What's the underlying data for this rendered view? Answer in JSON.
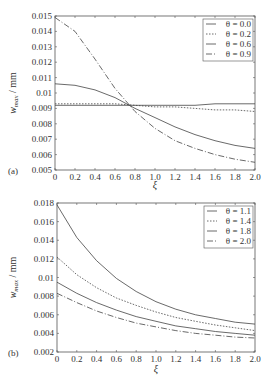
{
  "chart_data": [
    {
      "type": "line",
      "panel_label": "(a)",
      "title": "",
      "xlabel": "ξ",
      "ylabel": "w_max / mm",
      "xlim": [
        0,
        2.0
      ],
      "ylim": [
        0.005,
        0.015
      ],
      "x_ticks": [
        "0",
        "0.2",
        "0.4",
        "0.6",
        "0.8",
        "1.0",
        "1.2",
        "1.4",
        "1.6",
        "1.8",
        "2.0"
      ],
      "y_ticks": [
        "0.005",
        "0.006",
        "0.007",
        "0.008",
        "0.009",
        "0.01",
        "0.011",
        "0.012",
        "0.013",
        "0.014",
        "0.015"
      ],
      "grid": false,
      "legend_position": "upper right",
      "x": [
        0,
        0.2,
        0.4,
        0.6,
        0.8,
        1.0,
        1.2,
        1.4,
        1.6,
        1.8,
        2.0
      ],
      "series": [
        {
          "name": "θ = 0.0",
          "style": "solid",
          "values": [
            0.0092,
            0.0092,
            0.0092,
            0.0092,
            0.0092,
            0.0092,
            0.0092,
            0.0092,
            0.0093,
            0.0093,
            0.0093
          ]
        },
        {
          "name": "θ = 0.2",
          "style": "dotted",
          "values": [
            0.0093,
            0.0093,
            0.0093,
            0.0093,
            0.0092,
            0.0091,
            0.0091,
            0.009,
            0.0089,
            0.0089,
            0.0088
          ]
        },
        {
          "name": "θ = 0.6",
          "style": "solid",
          "values": [
            0.0106,
            0.0105,
            0.0102,
            0.0097,
            0.009,
            0.0084,
            0.0078,
            0.0073,
            0.0069,
            0.0066,
            0.0064
          ]
        },
        {
          "name": "θ = 0.9",
          "style": "dashdot",
          "values": [
            0.0149,
            0.014,
            0.0122,
            0.0103,
            0.0088,
            0.0077,
            0.0069,
            0.0064,
            0.006,
            0.0057,
            0.0055
          ]
        }
      ]
    },
    {
      "type": "line",
      "panel_label": "(b)",
      "title": "",
      "xlabel": "ξ",
      "ylabel": "w_max / mm",
      "xlim": [
        0,
        2.0
      ],
      "ylim": [
        0.002,
        0.018
      ],
      "x_ticks": [
        "0",
        "0.2",
        "0.4",
        "0.6",
        "0.8",
        "1.0",
        "1.2",
        "1.4",
        "1.6",
        "1.8",
        "2.0"
      ],
      "y_ticks": [
        "0.002",
        "0.004",
        "0.006",
        "0.008",
        "0.01",
        "0.012",
        "0.014",
        "0.016",
        "0.018"
      ],
      "grid": false,
      "legend_position": "upper right",
      "x": [
        0,
        0.2,
        0.4,
        0.6,
        0.8,
        1.0,
        1.2,
        1.4,
        1.6,
        1.8,
        2.0
      ],
      "series": [
        {
          "name": "θ = 1.1",
          "style": "solid",
          "values": [
            0.0178,
            0.0143,
            0.0118,
            0.0099,
            0.0085,
            0.0074,
            0.0066,
            0.006,
            0.0056,
            0.0052,
            0.005
          ]
        },
        {
          "name": "θ = 1.4",
          "style": "dotted",
          "values": [
            0.0122,
            0.0103,
            0.0089,
            0.0078,
            0.007,
            0.0063,
            0.0057,
            0.0053,
            0.0049,
            0.0046,
            0.0043
          ]
        },
        {
          "name": "θ = 1.8",
          "style": "solid",
          "values": [
            0.0095,
            0.0083,
            0.0073,
            0.0065,
            0.0058,
            0.0053,
            0.0048,
            0.0045,
            0.0042,
            0.004,
            0.0038
          ]
        },
        {
          "name": "θ = 2.0",
          "style": "dashdot",
          "values": [
            0.0083,
            0.0073,
            0.0064,
            0.0057,
            0.0051,
            0.0047,
            0.0043,
            0.004,
            0.0038,
            0.0036,
            0.0035
          ]
        }
      ]
    }
  ]
}
